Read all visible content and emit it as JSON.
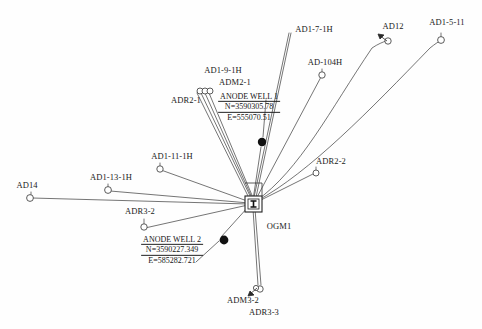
{
  "diagram": {
    "background_color": "#fefefe",
    "line_color": "#333333",
    "text_color": "#1a1a1a",
    "width": 482,
    "height": 329,
    "hub": {
      "name": "OGM1",
      "label": "OGM1",
      "label_x": 279,
      "label_y": 226,
      "symbol": "square-with-ibeam",
      "x": 253,
      "y": 204
    },
    "wells": [
      {
        "id": "AD1-7-1H",
        "label": "AD1-7-1H",
        "label_x": 314,
        "label_y": 29,
        "marker": "none",
        "node_x": 289,
        "node_y": 33
      },
      {
        "id": "AD12",
        "label": "AD12",
        "label_x": 393,
        "label_y": 26,
        "marker": "circle-arrow",
        "node_x": 388,
        "node_y": 41
      },
      {
        "id": "AD1-5-11",
        "label": "AD1-5-11",
        "label_x": 447,
        "label_y": 22,
        "marker": "circle",
        "node_x": 441,
        "node_y": 40
      },
      {
        "id": "AD-104H",
        "label": "AD-104H",
        "label_x": 325,
        "label_y": 62,
        "marker": "circle",
        "node_x": 322,
        "node_y": 75
      },
      {
        "id": "AD1-9-1H",
        "label": "AD1-9-1H",
        "label_x": 223,
        "label_y": 70,
        "marker": "circle",
        "node_x": 200,
        "node_y": 91
      },
      {
        "id": "ADM2-1",
        "label": "ADM2-1",
        "label_x": 235,
        "label_y": 82,
        "marker": "circle",
        "node_x": 204,
        "node_y": 91
      },
      {
        "id": "ADR2-1",
        "label": "ADR2-1",
        "label_x": 186,
        "label_y": 100,
        "marker": "circle",
        "node_x": 208,
        "node_y": 91
      },
      {
        "id": "ADR2-2",
        "label": "ADR2-2",
        "label_x": 331,
        "label_y": 161,
        "marker": "circle",
        "node_x": 315,
        "node_y": 173
      },
      {
        "id": "AD1-11-1H",
        "label": "AD1-11-1H",
        "label_x": 172,
        "label_y": 156,
        "marker": "circle",
        "node_x": 159,
        "node_y": 169
      },
      {
        "id": "AD1-13-1H",
        "label": "AD1-13-1H",
        "label_x": 111,
        "label_y": 177,
        "marker": "circle",
        "node_x": 107,
        "node_y": 190
      },
      {
        "id": "AD14",
        "label": "AD14",
        "label_x": 27,
        "label_y": 185,
        "marker": "circle",
        "node_x": 29,
        "node_y": 198
      },
      {
        "id": "ADR3-2",
        "label": "ADR3-2",
        "label_x": 140,
        "label_y": 211,
        "marker": "circle",
        "node_x": 143,
        "node_y": 227
      },
      {
        "id": "ADM3-2",
        "label": "ADM3-2",
        "label_x": 243,
        "label_y": 300,
        "marker": "circle-arrow",
        "node_x": 259,
        "node_y": 289
      },
      {
        "id": "ADR3-3",
        "label": "ADR3-3",
        "label_x": 264,
        "label_y": 312,
        "marker": "circle",
        "node_x": 262,
        "node_y": 289
      }
    ],
    "anode_wells": [
      {
        "id": "ANODE WELL 1",
        "title": "ANODE WELL 1",
        "northing": "N=3590305.78",
        "easting": "E=555070.51",
        "label_x": 249,
        "label_y": 107,
        "marker": "filled-dot",
        "node_x": 262,
        "node_y": 142
      },
      {
        "id": "ANODE WELL 2",
        "title": "ANODE WELL 2",
        "northing": "N=3590227.349",
        "easting": "E=585282.721",
        "label_x": 172,
        "label_y": 250,
        "marker": "filled-dot",
        "node_x": 224,
        "node_y": 240
      }
    ]
  }
}
